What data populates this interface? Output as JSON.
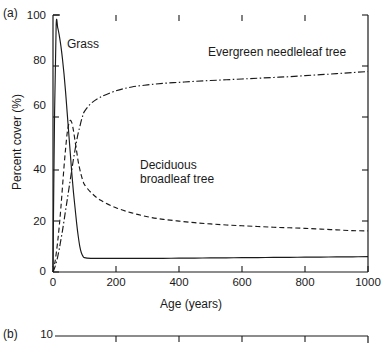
{
  "figure": {
    "panel_a_label": "(a)",
    "panel_b_label": "(b)",
    "panel_b_top_tick": "10"
  },
  "chart_data": {
    "type": "line",
    "title": "",
    "xlabel": "Age (years)",
    "ylabel": "Percent cover (%)",
    "xlim": [
      0,
      1000
    ],
    "ylim": [
      0,
      100
    ],
    "xticks": [
      "0",
      "200",
      "400",
      "600",
      "800",
      "1000"
    ],
    "xtick_values": [
      0,
      200,
      400,
      600,
      800,
      1000
    ],
    "yticks": [
      "0",
      "20",
      "40",
      "60",
      "80",
      "100"
    ],
    "ytick_values": [
      0,
      20,
      40,
      60,
      80,
      100
    ],
    "grid": false,
    "legend_position": "inline-annotations",
    "annotations": [
      {
        "name": "grass",
        "text": "Grass"
      },
      {
        "name": "evergreen",
        "text": "Evergreen needleleaf tree"
      },
      {
        "name": "deciduous_line1",
        "text": "Deciduous"
      },
      {
        "name": "deciduous_line2",
        "text": "broadleaf tree"
      }
    ],
    "x": [
      0,
      5,
      10,
      15,
      20,
      25,
      30,
      35,
      40,
      45,
      50,
      55,
      60,
      65,
      70,
      75,
      80,
      85,
      90,
      95,
      100,
      120,
      150,
      200,
      250,
      300,
      350,
      400,
      450,
      500,
      550,
      600,
      650,
      700,
      750,
      800,
      850,
      900,
      950,
      1000
    ],
    "series": [
      {
        "name": "Grass",
        "style": "solid",
        "color": "#1a1a1a",
        "values": [
          2,
          62,
          96,
          95,
          92,
          88,
          83,
          77,
          70,
          62,
          54,
          46,
          38,
          31,
          25,
          19,
          14,
          10,
          7.5,
          6.2,
          5.6,
          5.3,
          5.3,
          5.3,
          5.3,
          5.3,
          5.3,
          5.4,
          5.4,
          5.5,
          5.5,
          5.6,
          5.6,
          5.7,
          5.7,
          5.8,
          5.8,
          5.9,
          5.9,
          6.0
        ]
      },
      {
        "name": "Deciduous broadleaf tree",
        "style": "dashed",
        "color": "#1a1a1a",
        "values": [
          0,
          3,
          7,
          12,
          18,
          25,
          33,
          41,
          48,
          54,
          57.5,
          59,
          58,
          55,
          51,
          47,
          43,
          40,
          37.5,
          35.5,
          34,
          31,
          28,
          25,
          23,
          21.5,
          20.5,
          19.8,
          19.2,
          18.7,
          18.3,
          18.0,
          17.7,
          17.4,
          17.2,
          17.0,
          16.7,
          16.4,
          16.1,
          16.0
        ]
      },
      {
        "name": "Evergreen needleleaf tree",
        "style": "dashdot",
        "color": "#1a1a1a",
        "values": [
          0,
          1.5,
          3.5,
          6,
          9,
          12.5,
          16,
          20,
          24,
          28,
          32,
          36,
          40,
          44,
          47.5,
          51,
          54,
          56.5,
          59,
          61,
          62.5,
          65.5,
          68,
          70.5,
          72,
          72.8,
          73.4,
          73.8,
          74.2,
          74.5,
          74.8,
          75.1,
          75.4,
          75.7,
          76.0,
          76.4,
          76.8,
          77.2,
          77.6,
          78.0
        ]
      }
    ]
  }
}
